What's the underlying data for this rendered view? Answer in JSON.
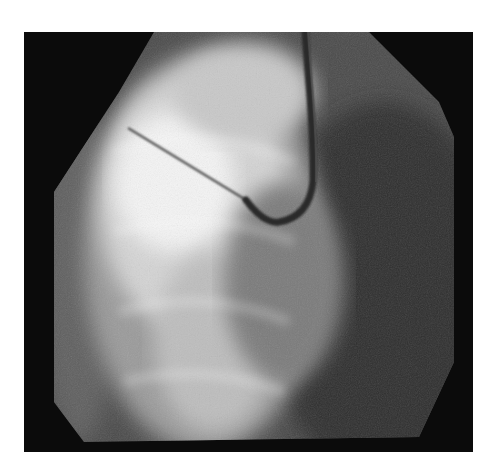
{
  "figure": {
    "kind": "fluoroscopy image",
    "colors": {
      "background": "#0b0b0b",
      "bright_tissue": "#f2f2f2",
      "mid_tissue": "#8a8a8a",
      "device": "#3a3a3a"
    },
    "objects": [
      {
        "name": "needle",
        "from": [
          128,
          128
        ],
        "to": [
          245,
          200
        ]
      },
      {
        "name": "j-curve-catheter",
        "entry": [
          305,
          32
        ],
        "tip": [
          245,
          200
        ]
      }
    ]
  }
}
